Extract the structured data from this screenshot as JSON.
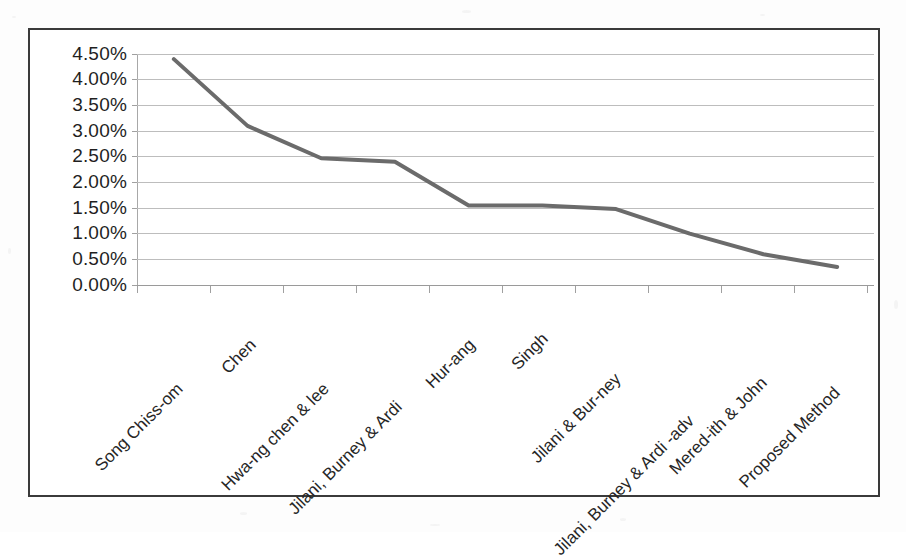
{
  "figure": {
    "background_color": "#fdfdfd",
    "frame_color": "#3a3a3a",
    "plot_background": "#ffffff"
  },
  "chart_data": {
    "type": "line",
    "title": "",
    "subtitle": "",
    "xlabel": "",
    "ylabel": "",
    "categories": [
      "Song Chiss-om",
      "Chen",
      "Hwa-ng chen & lee",
      "Jilani, Burney & Ardi",
      "Hur-ang",
      "Singh",
      "Jilani & Bur-ney",
      "Jilani, Burney & Ardi -adv",
      "Mered-ith & John",
      "Proposed Method"
    ],
    "values": [
      4.4,
      3.1,
      2.47,
      2.4,
      1.55,
      1.55,
      1.48,
      1.0,
      0.6,
      0.35
    ],
    "value_format": "percent",
    "ylim": [
      0.0,
      4.5
    ],
    "ytick_values": [
      0.0,
      0.5,
      1.0,
      1.5,
      2.0,
      2.5,
      3.0,
      3.5,
      4.0,
      4.5
    ],
    "ytick_labels": [
      "0.00%",
      "0.50%",
      "1.00%",
      "1.50%",
      "2.00%",
      "2.50%",
      "3.00%",
      "3.50%",
      "4.00%",
      "4.50%"
    ],
    "grid": true,
    "grid_color": "#bdbdbd",
    "legend": false,
    "legend_position": "none",
    "series": [
      {
        "name": "Error Rate",
        "color": "#6b6b6b",
        "line_width": 4,
        "markers": false,
        "values": [
          4.4,
          3.1,
          2.47,
          2.4,
          1.55,
          1.55,
          1.48,
          1.0,
          0.6,
          0.35
        ]
      }
    ],
    "annotations": []
  }
}
